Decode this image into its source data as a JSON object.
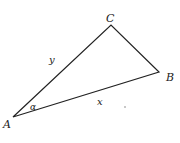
{
  "diagram": {
    "type": "triangle",
    "stroke_color": "#222222",
    "vertices": {
      "A": {
        "label": "A",
        "x": 13,
        "y": 117
      },
      "B": {
        "label": "B",
        "x": 159,
        "y": 72
      },
      "C": {
        "label": "C",
        "x": 111,
        "y": 25
      }
    },
    "sides": {
      "AC": {
        "label": "y"
      },
      "AB": {
        "label": "x"
      }
    },
    "angles": {
      "A": {
        "label": "α"
      }
    }
  }
}
